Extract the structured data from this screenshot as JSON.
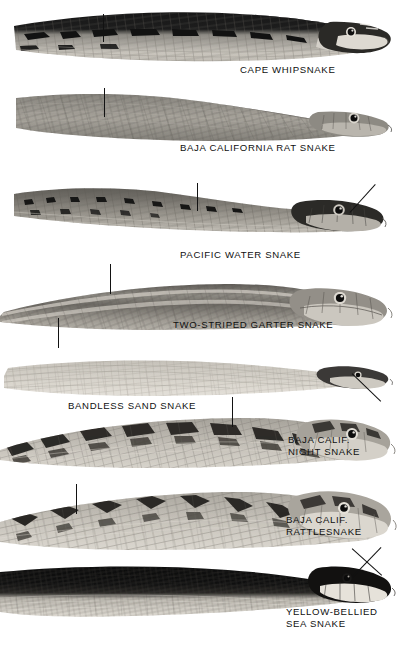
{
  "plate": {
    "type": "natural-history-illustration-plate",
    "medium": "black-and-white halftone photographic plate",
    "subject": "snake heads and forebodies in left profile",
    "background_color": "#ffffff",
    "ink_color": "#121212",
    "caption_count": 8,
    "caption_style": "all-uppercase sans-serif",
    "reading_order": "top to bottom"
  },
  "specimens": [
    {
      "index": 1,
      "caption": "CAPE WHIPSNAKE",
      "caption_lines": [
        "CAPE WHIPSNAKE"
      ],
      "caption_x": 240,
      "caption_y": 64,
      "caption_align": "left",
      "tone": "dark dorsal band over pale cream belly with bold black blotches",
      "body_y": 8,
      "body_height": 62,
      "leader": {
        "kind": "vertical",
        "x": 103,
        "y": 14,
        "length": 28
      }
    },
    {
      "index": 2,
      "caption": "BAJA CALIFORNIA RAT SNAKE",
      "caption_lines": [
        "BAJA CALIFORNIA RAT SNAKE"
      ],
      "caption_x": 180,
      "caption_y": 142,
      "caption_align": "left",
      "tone": "uniform mid-grey with fine keeled scale rows",
      "body_y": 86,
      "body_height": 58,
      "leader": {
        "kind": "vertical",
        "x": 104,
        "y": 88,
        "length": 29
      }
    },
    {
      "index": 3,
      "caption": "PACIFIC WATER SNAKE",
      "caption_lines": [
        "PACIFIC WATER SNAKE"
      ],
      "caption_x": 180,
      "caption_y": 249,
      "caption_align": "left",
      "tone": "dark dorsum with scattered black spots, pale lower flank",
      "body_y": 176,
      "body_height": 64,
      "leader": {
        "kind": "vertical",
        "x": 197,
        "y": 183,
        "length": 28
      },
      "leader2": {
        "kind": "diagonal",
        "x": 350,
        "y": 191,
        "length": 38,
        "angle": -48
      }
    },
    {
      "index": 4,
      "caption": "TWO-STRIPED GARTER SNAKE",
      "caption_lines": [
        "TWO-STRIPED GARTER SNAKE"
      ],
      "caption_x": 173,
      "caption_y": 319,
      "caption_align": "left",
      "tone": "dark olive grey with two pale lateral stripes",
      "body_y": 270,
      "body_height": 72,
      "leader": {
        "kind": "vertical",
        "x": 110,
        "y": 264,
        "length": 30
      },
      "leader2": {
        "kind": "vertical",
        "x": 58,
        "y": 318,
        "length": 30
      }
    },
    {
      "index": 5,
      "caption": "BANDLESS SAND SNAKE",
      "caption_lines": [
        "BANDLESS SAND SNAKE"
      ],
      "caption_x": 68,
      "caption_y": 400,
      "caption_align": "left",
      "tone": "very pale sandy grey, smooth unbanded",
      "body_y": 352,
      "body_height": 58,
      "leader": {
        "kind": "diagonal",
        "x": 352,
        "y": 373,
        "length": 40,
        "angle": 44
      }
    },
    {
      "index": 6,
      "caption": "BAJA CALIF.\nNIGHT SNAKE",
      "caption_lines": [
        "BAJA CALIF.",
        "NIGHT SNAKE"
      ],
      "caption_x": 288,
      "caption_y": 434,
      "caption_align": "left",
      "tone": "pale ground with large dark irregular dorsal blotches",
      "body_y": 405,
      "body_height": 72,
      "leader": {
        "kind": "vertical",
        "x": 232,
        "y": 397,
        "length": 30
      }
    },
    {
      "index": 7,
      "caption": "BAJA CALIF.\nRATTLESNAKE",
      "caption_lines": [
        "BAJA CALIF.",
        "RATTLESNAKE"
      ],
      "caption_x": 286,
      "caption_y": 514,
      "caption_align": "left",
      "tone": "pale grey ground with dark diamond dorsal blotches",
      "body_y": 480,
      "body_height": 78,
      "leader": {
        "kind": "vertical",
        "x": 76,
        "y": 484,
        "length": 30
      }
    },
    {
      "index": 8,
      "caption": "YELLOW-BELLIED\nSEA SNAKE",
      "caption_lines": [
        "YELLOW-BELLIED",
        "SEA SNAKE"
      ],
      "caption_x": 286,
      "caption_y": 606,
      "caption_align": "left",
      "tone": "jet-black dorsum sharply divided from pale belly",
      "body_y": 560,
      "body_height": 70,
      "leader": {
        "kind": "diagonal",
        "x": 352,
        "y": 548,
        "length": 40,
        "angle": 42
      }
    }
  ]
}
